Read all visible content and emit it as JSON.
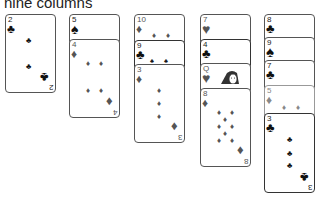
{
  "caption": "nine columns",
  "colors": {
    "red_suit": "#555555",
    "black_suit": "#111111",
    "border": "#555555",
    "background": "#ffffff"
  },
  "columns": [
    {
      "cards": [
        {
          "rank": "2",
          "suit": "clubs",
          "glyph": "♣",
          "face_up": true,
          "exposed": "full"
        }
      ]
    },
    {
      "cards": [
        {
          "rank": "5",
          "suit": "spades",
          "glyph": "♠",
          "exposed": "partial"
        },
        {
          "rank": "4",
          "suit": "diamonds",
          "glyph": "♦",
          "exposed": "full"
        }
      ]
    },
    {
      "cards": [
        {
          "rank": "10",
          "suit": "diamonds",
          "glyph": "♦",
          "exposed": "partial"
        },
        {
          "rank": "9",
          "suit": "clubs",
          "glyph": "♣",
          "exposed": "partial"
        },
        {
          "rank": "3",
          "suit": "diamonds",
          "glyph": "♦",
          "exposed": "full"
        }
      ]
    },
    {
      "cards": [
        {
          "rank": "7",
          "suit": "hearts",
          "glyph": "♥",
          "exposed": "partial"
        },
        {
          "rank": "4",
          "suit": "clubs",
          "glyph": "♣",
          "exposed": "partial"
        },
        {
          "rank": "Q",
          "suit": "hearts",
          "glyph": "♥",
          "exposed": "partial"
        },
        {
          "rank": "8",
          "suit": "diamonds",
          "glyph": "♦",
          "exposed": "full"
        }
      ]
    },
    {
      "cards": [
        {
          "rank": "8",
          "suit": "clubs",
          "glyph": "♣",
          "exposed": "partial"
        },
        {
          "rank": "9",
          "suit": "spades",
          "glyph": "♠",
          "exposed": "partial"
        },
        {
          "rank": "7",
          "suit": "clubs",
          "glyph": "♣",
          "exposed": "partial"
        },
        {
          "rank": "5",
          "suit": "diamonds",
          "glyph": "♦",
          "exposed": "partial"
        },
        {
          "rank": "3",
          "suit": "clubs",
          "glyph": "♣",
          "exposed": "full"
        }
      ]
    }
  ]
}
